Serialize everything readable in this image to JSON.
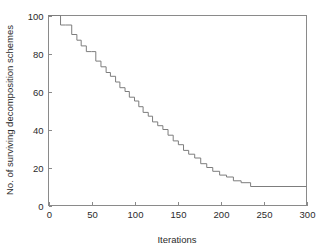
{
  "chart_data": {
    "type": "line",
    "title": "",
    "subtitle": "",
    "xlabel": "Iterations",
    "ylabel": "No. of surviving decomposition schemes",
    "xlim": [
      0,
      300
    ],
    "ylim": [
      0,
      100
    ],
    "xticks": [
      0,
      50,
      100,
      150,
      200,
      250,
      300
    ],
    "yticks": [
      0,
      20,
      40,
      60,
      80,
      100
    ],
    "xtick_labels": [
      "0",
      "50",
      "100",
      "150",
      "200",
      "250",
      "300"
    ],
    "ytick_labels": [
      "0",
      "20",
      "40",
      "60",
      "80",
      "100"
    ],
    "grid": false,
    "legend": null,
    "legend_position": "none",
    "annotations": [],
    "line_style": "staircase",
    "line_color": "#7d7d7d",
    "axis_color": "#8a8a8a",
    "background_color": "#ffffff",
    "series": [
      {
        "name": "No. of surviving decomposition schemes",
        "step": "post",
        "x": [
          0,
          10,
          14,
          20,
          27,
          33,
          38,
          44,
          50,
          55,
          61,
          67,
          72,
          78,
          83,
          89,
          94,
          100,
          105,
          110,
          116,
          121,
          127,
          133,
          139,
          145,
          151,
          157,
          163,
          170,
          177,
          184,
          191,
          199,
          207,
          215,
          224,
          235,
          300
        ],
        "y": [
          100,
          100,
          95,
          95,
          90,
          87,
          84,
          81,
          81,
          76,
          73,
          70,
          68,
          65,
          62,
          60,
          57,
          55,
          52,
          49,
          47,
          44,
          42,
          40,
          37,
          34,
          32,
          29,
          27,
          25,
          22,
          20,
          18,
          16,
          15,
          13,
          12,
          10,
          10
        ]
      }
    ]
  },
  "axes": {
    "x_axis_name": "iterations-axis",
    "y_axis_name": "surviving-schemes-axis"
  }
}
